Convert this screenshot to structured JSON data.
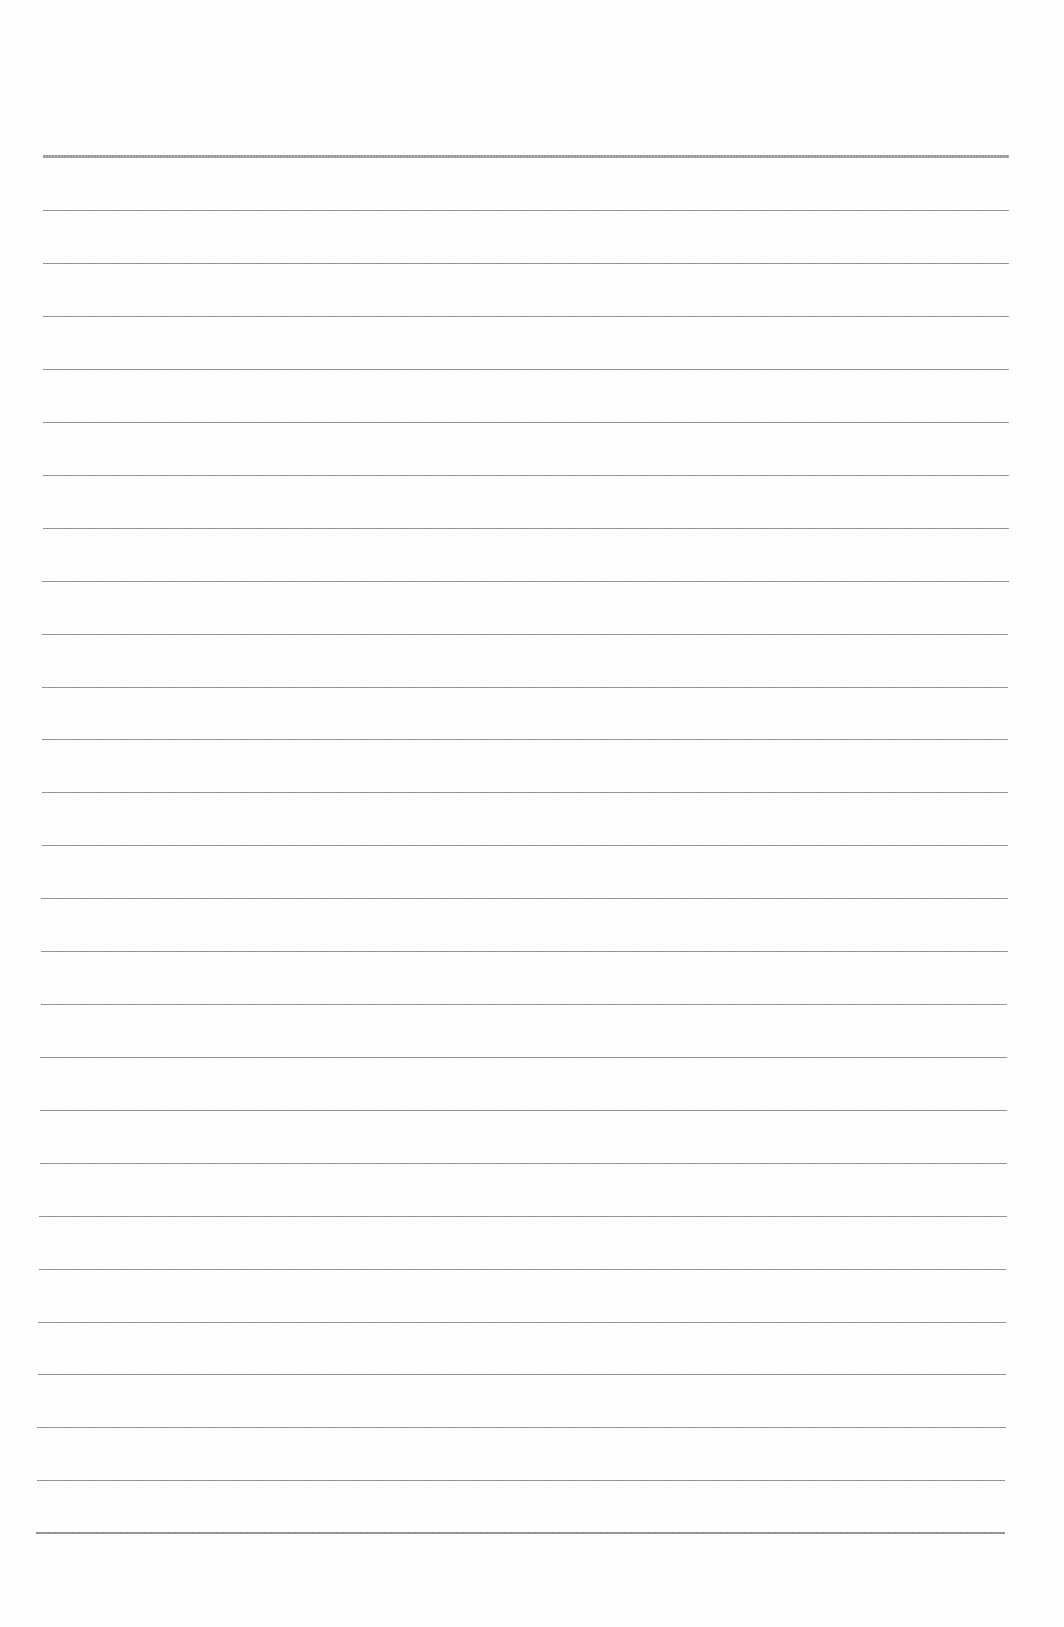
{
  "document": {
    "type": "blank lined paper",
    "line_count": 27,
    "line_color": "#8d8d8d",
    "background": "#fefefe",
    "lines": [
      {
        "y": 156,
        "x1": 43,
        "x2": 1009,
        "weight": "heavy"
      },
      {
        "y": 210,
        "x1": 43,
        "x2": 1009
      },
      {
        "y": 263,
        "x1": 43,
        "x2": 1009
      },
      {
        "y": 316,
        "x1": 43,
        "x2": 1009
      },
      {
        "y": 369,
        "x1": 43,
        "x2": 1009
      },
      {
        "y": 422,
        "x1": 43,
        "x2": 1009
      },
      {
        "y": 475,
        "x1": 43,
        "x2": 1009
      },
      {
        "y": 528,
        "x1": 43,
        "x2": 1009
      },
      {
        "y": 581,
        "x1": 42,
        "x2": 1009
      },
      {
        "y": 634,
        "x1": 42,
        "x2": 1008
      },
      {
        "y": 687,
        "x1": 42,
        "x2": 1008
      },
      {
        "y": 739,
        "x1": 42,
        "x2": 1008
      },
      {
        "y": 792,
        "x1": 42,
        "x2": 1008
      },
      {
        "y": 845,
        "x1": 42,
        "x2": 1008
      },
      {
        "y": 898,
        "x1": 41,
        "x2": 1008
      },
      {
        "y": 951,
        "x1": 41,
        "x2": 1008
      },
      {
        "y": 1004,
        "x1": 41,
        "x2": 1007
      },
      {
        "y": 1057,
        "x1": 40,
        "x2": 1007
      },
      {
        "y": 1110,
        "x1": 40,
        "x2": 1007
      },
      {
        "y": 1163,
        "x1": 40,
        "x2": 1007
      },
      {
        "y": 1216,
        "x1": 39,
        "x2": 1007
      },
      {
        "y": 1269,
        "x1": 39,
        "x2": 1006
      },
      {
        "y": 1322,
        "x1": 38,
        "x2": 1006
      },
      {
        "y": 1374,
        "x1": 38,
        "x2": 1006
      },
      {
        "y": 1427,
        "x1": 37,
        "x2": 1006
      },
      {
        "y": 1480,
        "x1": 37,
        "x2": 1005
      },
      {
        "y": 1532,
        "x1": 36,
        "x2": 1005,
        "weight": "bottom"
      }
    ]
  }
}
